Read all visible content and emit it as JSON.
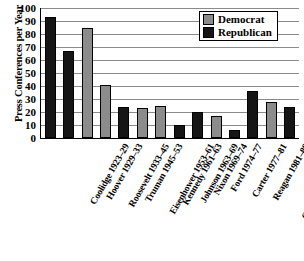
{
  "chart_data": {
    "type": "bar",
    "title": "",
    "xlabel": "",
    "ylabel": "Press Conferences per Year",
    "ylim": [
      0,
      100
    ],
    "ytick_step": 10,
    "yticks": [
      0,
      10,
      20,
      30,
      40,
      50,
      60,
      70,
      80,
      90,
      100
    ],
    "grid": true,
    "legend_position": "top-right",
    "categories": [
      "Coolidge 1923–29",
      "Hoover 1929–33",
      "Roosevelt 1933–45",
      "Truman 1945–53",
      "Eisenhower 1953–61",
      "Kennedy 1961–63",
      "Johnson 1963–69",
      "Nixon 1969–74",
      "Ford 1974–77",
      "Carter 1977–81",
      "Reagan 1981–89",
      "G.H.W. Bush 1989–93",
      "Clinton 1993–2001",
      "G.W. Bush 2001–04"
    ],
    "values": [
      93,
      67,
      85,
      41,
      24,
      23,
      25,
      10,
      20,
      17,
      6,
      36,
      28,
      24
    ],
    "parties": [
      "Republican",
      "Republican",
      "Democrat",
      "Democrat",
      "Republican",
      "Democrat",
      "Democrat",
      "Republican",
      "Republican",
      "Democrat",
      "Republican",
      "Republican",
      "Democrat",
      "Republican"
    ],
    "series": [
      {
        "name": "Democrat",
        "color": "#8c8c8c",
        "points": [
          {
            "category": "Roosevelt 1933–45",
            "value": 85
          },
          {
            "category": "Truman 1945–53",
            "value": 41
          },
          {
            "category": "Kennedy 1961–63",
            "value": 23
          },
          {
            "category": "Johnson 1963–69",
            "value": 25
          },
          {
            "category": "Carter 1977–81",
            "value": 17
          },
          {
            "category": "Clinton 1993–2001",
            "value": 28
          }
        ]
      },
      {
        "name": "Republican",
        "color": "#151515",
        "points": [
          {
            "category": "Coolidge 1923–29",
            "value": 93
          },
          {
            "category": "Hoover 1929–33",
            "value": 67
          },
          {
            "category": "Eisenhower 1953–61",
            "value": 24
          },
          {
            "category": "Nixon 1969–74",
            "value": 10
          },
          {
            "category": "Ford 1974–77",
            "value": 20
          },
          {
            "category": "Reagan 1981–89",
            "value": 6
          },
          {
            "category": "G.H.W. Bush 1989–93",
            "value": 36
          },
          {
            "category": "G.W. Bush 2001–04",
            "value": 24
          }
        ]
      }
    ],
    "legend": [
      {
        "label": "Democrat",
        "color": "#8c8c8c"
      },
      {
        "label": "Republican",
        "color": "#151515"
      }
    ]
  }
}
